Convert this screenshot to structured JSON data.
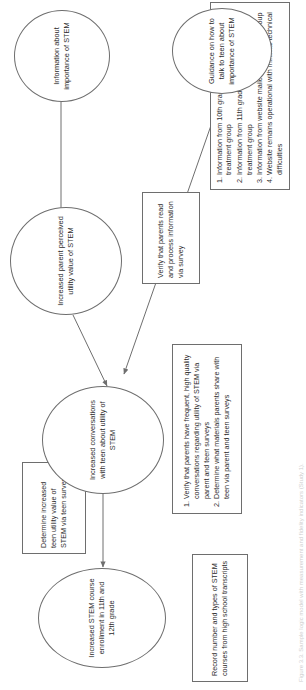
{
  "figure": {
    "type": "logic-model-flowchart",
    "orientation": "rotated-90-ccw",
    "caption": "Figure 3.3. Sample logic model with measurement and fidelity indicators (Study 1)."
  },
  "nodes": {
    "outcome_enrollment": {
      "shape": "ellipse",
      "label": "Increased STEM course enrollment in 11th and 12th grade"
    },
    "measure_transcripts": {
      "shape": "rect",
      "label": "Record number and types of STEM courses from high school transcripts"
    },
    "measure_teen_utility": {
      "shape": "rect",
      "label": "Determine increased teen utility value of STEM via teen survey"
    },
    "outcome_conversations": {
      "shape": "ellipse",
      "label": "Increased conversations with teen about utility of STEM"
    },
    "measure_conversations": {
      "shape": "rect",
      "items": [
        "Verify that parents have frequent, high quality conversations regarding utility of STEM via parent and teen surveys",
        "Determine what materials parents share with teen via parent and teen surveys"
      ]
    },
    "outcome_parent_utility": {
      "shape": "ellipse",
      "label": "Increased parent perceived utility value of STEM"
    },
    "measure_parent_reads": {
      "shape": "rect",
      "label": "Verify that parents read and process information via survey"
    },
    "input_information": {
      "shape": "ellipse",
      "label": "Information about importance of STEM"
    },
    "measure_inputs": {
      "shape": "rect",
      "items": [
        "Information from 10th grade brochure mailed to treatment group",
        "Information from 11th grade brochure mailed to treatment group",
        "Information from website mailed to treatment group",
        "Website remains operational with minimal technical difficulties"
      ]
    },
    "input_guidance": {
      "shape": "ellipse",
      "label": "Guidance on how to talk to teen about importance of STEM"
    }
  },
  "edges": [
    {
      "from": "outcome_conversations",
      "to": "outcome_enrollment",
      "style": "solid-arrow"
    },
    {
      "from": "outcome_parent_utility",
      "to": "outcome_conversations",
      "style": "solid-arrow"
    },
    {
      "from": "input_guidance",
      "to": "outcome_conversations",
      "style": "solid-arrow"
    },
    {
      "from": "input_information",
      "to": "outcome_parent_utility",
      "style": "solid-arrow"
    }
  ],
  "colors": {
    "stroke": "#6e6e6e",
    "text": "#2b2b2b",
    "background": "#ffffff",
    "caption": "#cfcfcf"
  }
}
